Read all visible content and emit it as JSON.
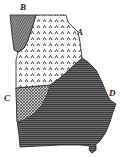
{
  "map": {
    "subject": "State outline divided into four shaded regions",
    "regions": [
      {
        "id": "A",
        "label": "A",
        "pattern": "dotted-chevrons",
        "fill": "#ffffff",
        "ink": "#333333"
      },
      {
        "id": "B",
        "label": "B",
        "pattern": "fine-diagonal-hatch",
        "fill": "#6a6a6a",
        "ink": "#2a2a2a"
      },
      {
        "id": "C",
        "label": "C",
        "pattern": "crosshatch",
        "fill": "#8a8a8a",
        "ink": "#333333"
      },
      {
        "id": "D",
        "label": "D",
        "pattern": "horizontal-lines",
        "fill": "#5a5a5a",
        "ink": "#3a3a3a"
      }
    ]
  },
  "labels": {
    "a": "A",
    "b": "B",
    "c": "C",
    "d": "D"
  }
}
